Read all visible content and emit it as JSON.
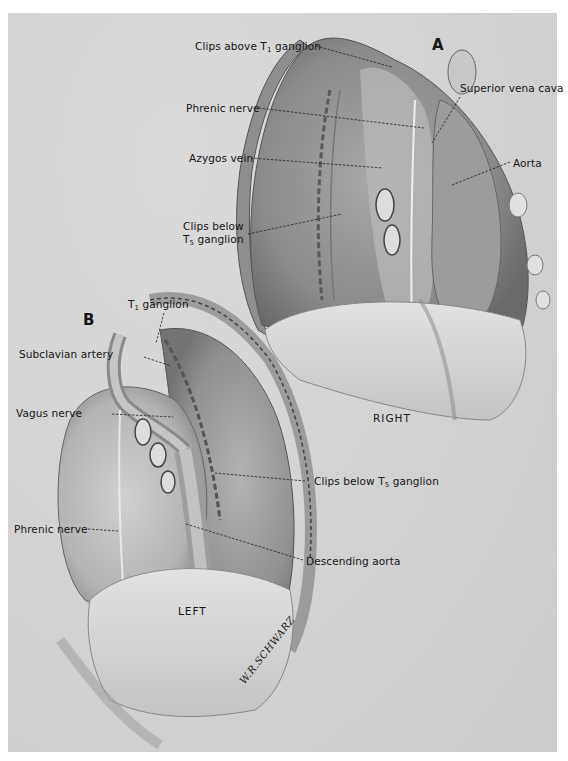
{
  "figure": {
    "panel_a": {
      "letter": "A",
      "side_label": "RIGHT",
      "labels": {
        "clips_above_t1": {
          "pre": "Clips above T",
          "sub": "1",
          "post": " ganglion"
        },
        "superior_vena_cava": "Superior vena cava",
        "phrenic_nerve": "Phrenic nerve",
        "azygos_vein": "Azygos vein",
        "aorta": "Aorta",
        "clips_below_t5_line1": "Clips below",
        "clips_below_t5_line2": {
          "pre": "T",
          "sub": "5",
          "post": " ganglion"
        }
      }
    },
    "panel_b": {
      "letter": "B",
      "side_label": "LEFT",
      "labels": {
        "t1_ganglion": {
          "pre": "T",
          "sub": "1",
          "post": " ganglion"
        },
        "subclavian_artery": "Subclavian artery",
        "vagus_nerve": "Vagus nerve",
        "clips_below_t5": {
          "pre": "Clips below T",
          "sub": "5",
          "post": " ganglion"
        },
        "phrenic_nerve": "Phrenic nerve",
        "descending_aorta": "Descending aorta"
      }
    },
    "signature": "W.R.SCHWARZ",
    "colors": {
      "plate": "#d3d3d3",
      "ink": "#151515",
      "shade_dark": "#6e6e6e",
      "shade_mid": "#9a9a9a",
      "shade_light": "#e4e4e4"
    }
  }
}
